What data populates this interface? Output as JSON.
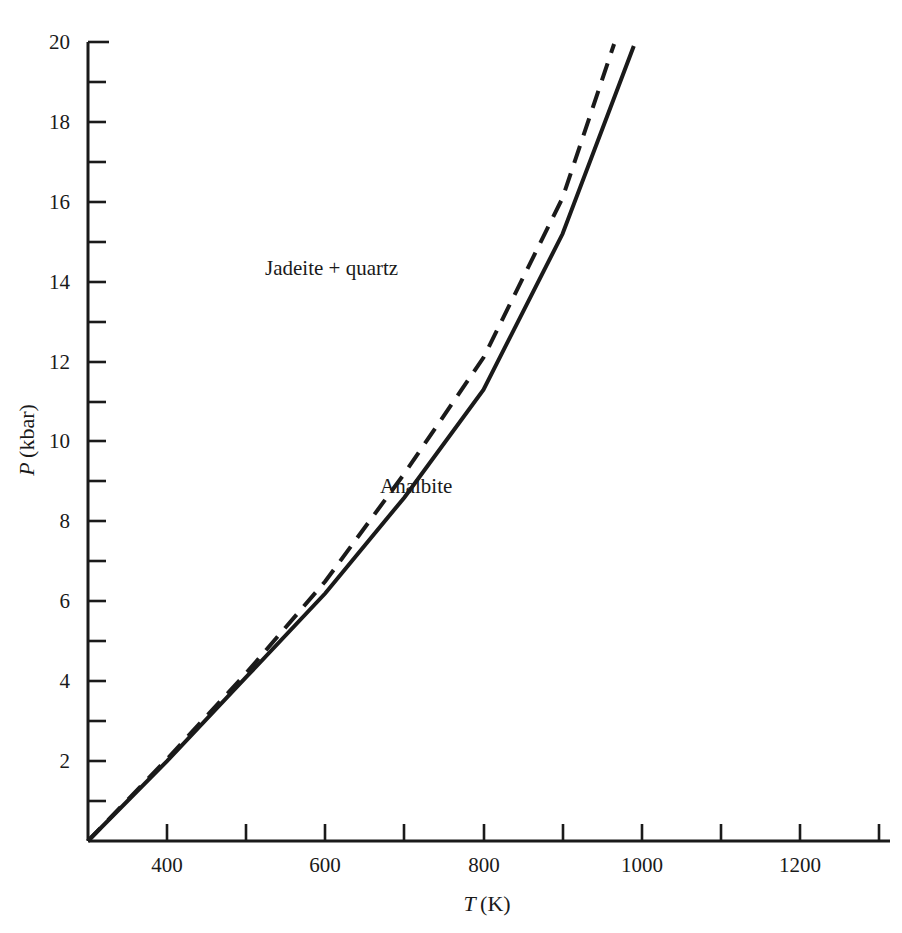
{
  "chart_data": {
    "type": "line",
    "title": "",
    "xlabel": "T (K)",
    "ylabel": "P (kbar)",
    "xlim": [
      300,
      1300
    ],
    "ylim": [
      0,
      20
    ],
    "grid": false,
    "legend": null,
    "x_ticks_major": [
      400,
      600,
      800,
      1000,
      1200
    ],
    "x_ticks_minor": [
      300,
      500,
      700,
      900,
      1100,
      1300
    ],
    "x_tick_labels": [
      "400",
      "600",
      "800",
      "1000",
      "1200"
    ],
    "y_ticks": [
      0,
      2,
      4,
      6,
      8,
      10,
      12,
      14,
      16,
      18,
      20
    ],
    "y_tick_labels": [
      "2",
      "4",
      "6",
      "8",
      "10",
      "12",
      "14",
      "16",
      "18",
      "20"
    ],
    "annotations": [
      {
        "text": "Jadeite + quartz",
        "x": 480,
        "y": 14.5
      },
      {
        "text": "Analbite",
        "x": 670,
        "y": 9.0
      }
    ],
    "series": [
      {
        "name": "equilibrium-boundary-solid",
        "style": "solid",
        "color": "#1a1a1a",
        "points": [
          [
            300,
            0.0
          ],
          [
            400,
            2.0
          ],
          [
            500,
            4.1
          ],
          [
            600,
            6.2
          ],
          [
            700,
            8.6
          ],
          [
            800,
            11.3
          ],
          [
            900,
            15.2
          ],
          [
            990,
            19.9
          ]
        ]
      },
      {
        "name": "equilibrium-boundary-dashed",
        "style": "dashed",
        "color": "#1a1a1a",
        "points": [
          [
            300,
            0.0
          ],
          [
            400,
            2.05
          ],
          [
            500,
            4.2
          ],
          [
            600,
            6.5
          ],
          [
            700,
            9.2
          ],
          [
            800,
            12.1
          ],
          [
            900,
            16.1
          ],
          [
            965,
            19.95
          ]
        ]
      }
    ]
  },
  "axes": {
    "x_axis_name": "temperature-axis",
    "y_axis_name": "pressure-axis"
  }
}
